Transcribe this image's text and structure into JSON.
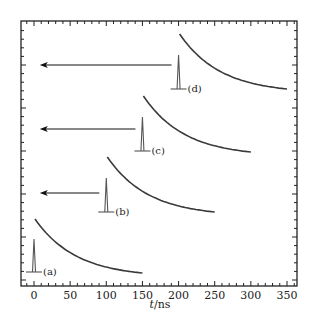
{
  "caption_fragment": "",
  "chart_data": {
    "type": "line",
    "title": "",
    "xlabel": "t/ns",
    "ylabel": "",
    "xlim": [
      -18,
      365
    ],
    "x_ticks": [
      0,
      50,
      100,
      150,
      200,
      250,
      300,
      350
    ],
    "grid": false,
    "legend": null,
    "annotations": [
      "(a)",
      "(b)",
      "(c)",
      "(d)"
    ],
    "series": [
      {
        "name": "(a)",
        "pulse_t": 0,
        "decay_start_t": 0,
        "decay_end_t": 150,
        "arrow": false
      },
      {
        "name": "(b)",
        "pulse_t": 100,
        "decay_start_t": 100,
        "decay_end_t": 250,
        "arrow": true,
        "arrow_to_t": 8
      },
      {
        "name": "(c)",
        "pulse_t": 150,
        "decay_start_t": 150,
        "decay_end_t": 300,
        "arrow": true,
        "arrow_to_t": 8
      },
      {
        "name": "(d)",
        "pulse_t": 200,
        "decay_start_t": 200,
        "decay_end_t": 350,
        "arrow": true,
        "arrow_to_t": 8
      }
    ],
    "decay_shape": "exponential",
    "colors": {
      "curve": "#3a3a3a",
      "pulse": "#555555",
      "arrow": "#111111",
      "axis": "#222222"
    }
  }
}
